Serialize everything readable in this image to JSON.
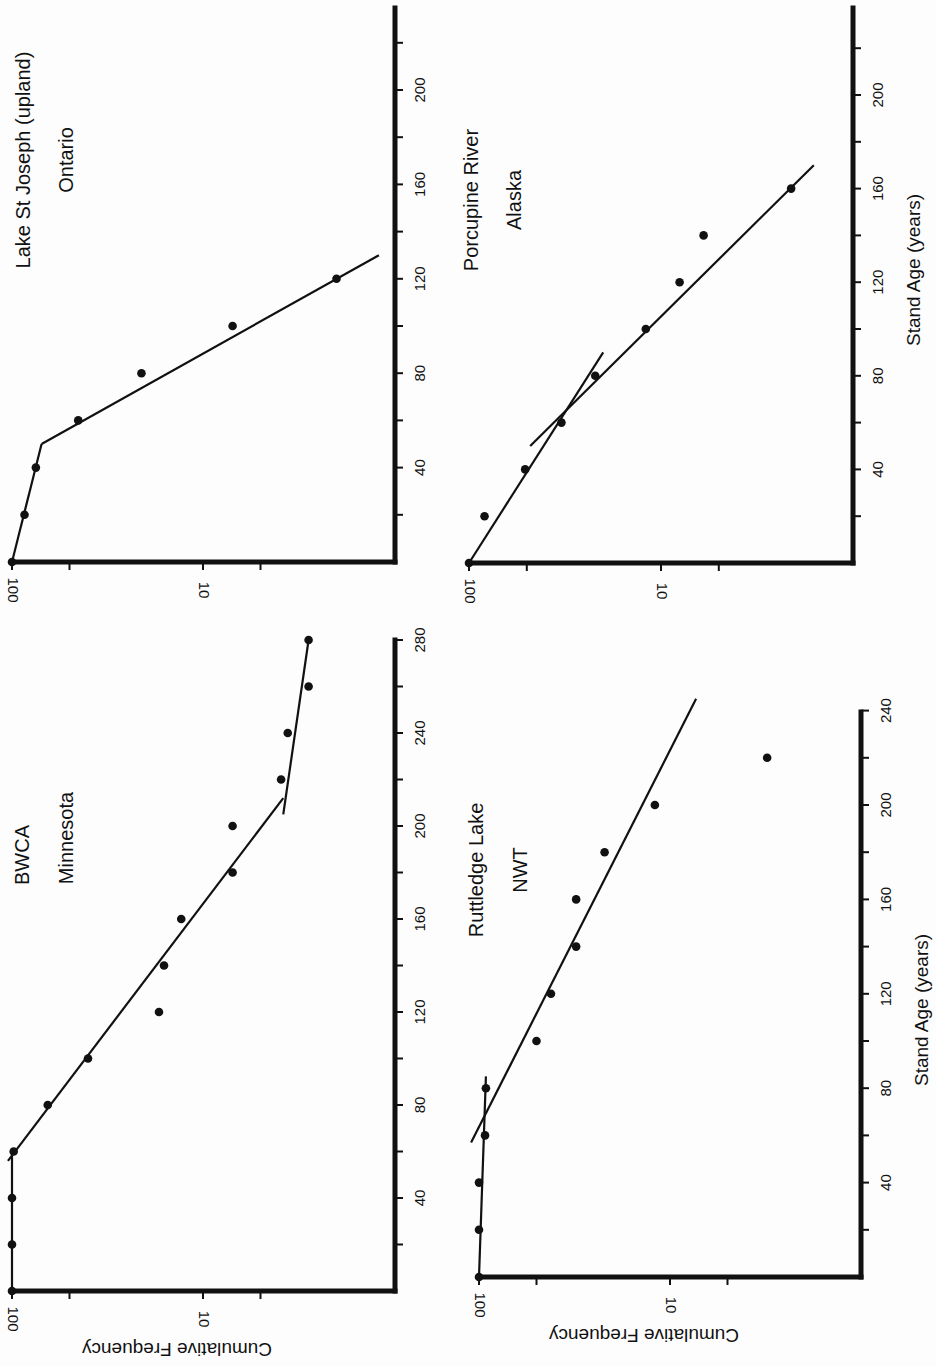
{
  "figure": {
    "rotation_note": "Figure printed rotated 90 degrees clockwise",
    "ylabel": "Cumulative Frequency",
    "xlabel": "Stand Age (years)"
  },
  "panels": [
    {
      "id": "lake-st-joseph",
      "title_line1": "Lake St Joseph (upland)",
      "title_line2": "Ontario",
      "x_ticks": [
        "40",
        "80",
        "120",
        "160",
        "200"
      ],
      "y_ticks": [
        "100",
        "10"
      ],
      "show_xlabel": false,
      "show_ylabel": false
    },
    {
      "id": "porcupine-river",
      "title_line1": "Porcupine River",
      "title_line2": "Alaska",
      "x_ticks": [
        "40",
        "80",
        "120",
        "160",
        "200"
      ],
      "y_ticks": [
        "100",
        "10"
      ],
      "show_xlabel": true,
      "show_ylabel": false
    },
    {
      "id": "bwca",
      "title_line1": "BWCA",
      "title_line2": "Minnesota",
      "x_ticks": [
        "40",
        "80",
        "120",
        "160",
        "200",
        "240",
        "280"
      ],
      "y_ticks": [
        "100",
        "10"
      ],
      "show_xlabel": false,
      "show_ylabel": true
    },
    {
      "id": "ruttledge-lake",
      "title_line1": "Ruttledge Lake",
      "title_line2": "NWT",
      "x_ticks": [
        "40",
        "80",
        "120",
        "160",
        "200",
        "240"
      ],
      "y_ticks": [
        "100",
        "10"
      ],
      "show_xlabel": true,
      "show_ylabel": true
    }
  ],
  "chart_data": [
    {
      "type": "scatter",
      "title": "Lake St Joseph (upland) Ontario",
      "xlabel": "Stand Age (years)",
      "ylabel": "Cumulative Frequency",
      "yscale": "log",
      "ylim": [
        1,
        100
      ],
      "xlim": [
        0,
        235
      ],
      "x_ticks": [
        40,
        80,
        120,
        160,
        200
      ],
      "y_ticks": [
        100,
        10
      ],
      "x": [
        0,
        20,
        40,
        60,
        80,
        100,
        120
      ],
      "y": [
        100,
        86,
        75,
        45,
        21,
        7,
        2
      ],
      "fit_lines": [
        {
          "x": [
            0,
            50
          ],
          "y": [
            100,
            70
          ]
        },
        {
          "x": [
            50,
            130
          ],
          "y": [
            70,
            1.2
          ]
        }
      ],
      "grid": false
    },
    {
      "type": "scatter",
      "title": "Porcupine River Alaska",
      "xlabel": "Stand Age (years)",
      "ylabel": "Cumulative Frequency",
      "yscale": "log",
      "ylim": [
        1,
        100
      ],
      "xlim": [
        0,
        235
      ],
      "x_ticks": [
        40,
        80,
        120,
        160,
        200
      ],
      "y_ticks": [
        100,
        10
      ],
      "x": [
        0,
        20,
        40,
        60,
        80,
        100,
        120,
        140,
        160
      ],
      "y": [
        100,
        83,
        51,
        33,
        22,
        12,
        8,
        6,
        2.1
      ],
      "fit_lines": [
        {
          "x": [
            0,
            90
          ],
          "y": [
            100,
            20
          ]
        },
        {
          "x": [
            50,
            170
          ],
          "y": [
            48,
            1.6
          ]
        }
      ],
      "grid": false
    },
    {
      "type": "scatter",
      "title": "BWCA Minnesota",
      "xlabel": "Stand Age (years)",
      "ylabel": "Cumulative Frequency",
      "yscale": "log",
      "ylim": [
        1,
        100
      ],
      "xlim": [
        0,
        280
      ],
      "x_ticks": [
        40,
        80,
        120,
        160,
        200,
        240,
        280
      ],
      "y_ticks": [
        100,
        10
      ],
      "x": [
        0,
        20,
        40,
        60,
        80,
        100,
        120,
        140,
        160,
        180,
        200,
        220,
        240,
        260,
        280
      ],
      "y": [
        100,
        100,
        100,
        98,
        65,
        40,
        17,
        16,
        13,
        7,
        7,
        3.9,
        3.6,
        2.8,
        2.8
      ],
      "fit_lines": [
        {
          "x": [
            0,
            60
          ],
          "y": [
            100,
            100
          ]
        },
        {
          "x": [
            56,
            212
          ],
          "y": [
            105,
            3.8
          ]
        },
        {
          "x": [
            205,
            280
          ],
          "y": [
            3.8,
            2.8
          ]
        }
      ],
      "grid": false
    },
    {
      "type": "scatter",
      "title": "Ruttledge Lake NWT",
      "xlabel": "Stand Age (years)",
      "ylabel": "Cumulative Frequency",
      "yscale": "log",
      "ylim": [
        1,
        100
      ],
      "xlim": [
        0,
        240
      ],
      "x_ticks": [
        40,
        80,
        120,
        160,
        200,
        240
      ],
      "y_ticks": [
        100,
        10
      ],
      "x": [
        0,
        20,
        40,
        60,
        80,
        100,
        120,
        140,
        160,
        180,
        200,
        220
      ],
      "y": [
        100,
        100,
        100,
        93,
        92,
        50,
        42,
        31,
        31,
        22,
        12,
        3.1
      ],
      "fit_lines": [
        {
          "x": [
            0,
            85
          ],
          "y": [
            100,
            92
          ]
        },
        {
          "x": [
            57,
            245
          ],
          "y": [
            110,
            7.3
          ]
        }
      ],
      "grid": false
    }
  ],
  "layout": [
    {
      "axisX": 395,
      "origin_y": 562,
      "top_y": 8,
      "px_per_year": 2.36,
      "y100_x": 12,
      "decade_px": 191,
      "axis_end_x": 395
    },
    {
      "axisX": 853,
      "origin_y": 563,
      "top_y": 8,
      "px_per_year": 2.34,
      "y100_x": 469,
      "decade_px": 192,
      "axis_end_x": 853
    },
    {
      "axisX": 395,
      "origin_y": 1291,
      "top_y": 640,
      "px_per_year": 2.325,
      "y100_x": 12,
      "decade_px": 191,
      "axis_end_x": 395
    },
    {
      "axisX": 861,
      "origin_y": 1277,
      "top_y": 712,
      "px_per_year": 2.36,
      "y100_x": 479,
      "decade_px": 191,
      "axis_end_x": 861
    }
  ]
}
